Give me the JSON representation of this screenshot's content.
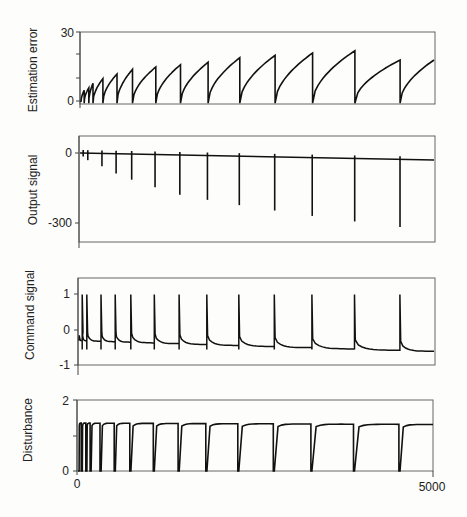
{
  "chart_data": [
    {
      "type": "line",
      "title": "",
      "xlabel": "",
      "ylabel": "Estimation error",
      "xlim": [
        0,
        5000
      ],
      "ylim": [
        -3,
        30
      ],
      "yticks": [
        "30",
        "0"
      ],
      "grid": false,
      "description": "Sawtooth: error rises concavely after each reset and drops to ~0 at each event; peaks grow from ~5 to ~22",
      "events_x": [
        45,
        110,
        170,
        310,
        510,
        730,
        1060,
        1410,
        1800,
        2250,
        2750,
        3280,
        3880,
        4520
      ],
      "peaks": [
        5,
        6,
        8,
        10,
        12,
        14,
        15,
        16,
        17,
        19,
        20,
        21,
        22,
        18
      ]
    },
    {
      "type": "line",
      "title": "",
      "xlabel": "",
      "ylabel": "Output signal",
      "xlim": [
        0,
        5000
      ],
      "ylim": [
        -380,
        40
      ],
      "yticks": [
        "0",
        "-300"
      ],
      "grid": false,
      "description": "Baseline near 0 with downward spikes at each event, spike depth growing over time",
      "events_x": [
        45,
        110,
        310,
        510,
        730,
        1060,
        1410,
        1800,
        2250,
        2750,
        3280,
        3880,
        4520
      ],
      "spike_min": [
        -15,
        -30,
        -55,
        -85,
        -110,
        -140,
        -170,
        -190,
        -210,
        -230,
        -250,
        -270,
        -290
      ]
    },
    {
      "type": "line",
      "title": "",
      "xlabel": "",
      "ylabel": "Command signal",
      "xlim": [
        0,
        5000
      ],
      "ylim": [
        -1.1,
        1.4
      ],
      "yticks": [
        "1",
        "0",
        "-1"
      ],
      "grid": false,
      "description": "Sharp spikes to ~1 at each event then decays to baseline around -0.3 to -0.6",
      "events_x": [
        45,
        110,
        310,
        510,
        730,
        1060,
        1410,
        1800,
        2250,
        2750,
        3280,
        3880,
        4520
      ],
      "baseline_end": -0.6
    },
    {
      "type": "line",
      "title": "",
      "xlabel": "",
      "ylabel": "Disturbance",
      "xlim": [
        0,
        5000
      ],
      "ylim": [
        0,
        2
      ],
      "yticks": [
        "2",
        "0"
      ],
      "xticks": [
        "0",
        "5000"
      ],
      "grid": false,
      "description": "Square-ish pulses: drops to 0 at each event, recovers quickly to ~1.3-1.4",
      "events_x": [
        45,
        110,
        170,
        310,
        510,
        730,
        1060,
        1410,
        1800,
        2250,
        2750,
        3280,
        3880,
        4520
      ],
      "plateau": 1.35
    }
  ],
  "panels": {
    "p1": {
      "ylabel": "Estimation error",
      "ytick_top": "30",
      "ytick_zero": "0"
    },
    "p2": {
      "ylabel": "Output signal",
      "ytick_zero": "0",
      "ytick_low": "-300"
    },
    "p3": {
      "ylabel": "Command signal",
      "ytick_top": "1",
      "ytick_zero": "0",
      "ytick_low": "-1"
    },
    "p4": {
      "ylabel": "Disturbance",
      "ytick_top": "2",
      "ytick_zero": "0",
      "xtick_start": "0",
      "xtick_end": "5000"
    }
  },
  "colors": {
    "line": "#111111",
    "axis": "#555555",
    "background": "#fdfdfb"
  }
}
